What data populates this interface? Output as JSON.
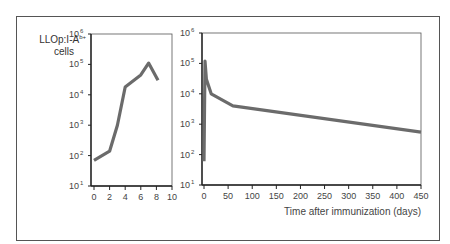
{
  "chart_data": [
    {
      "type": "line",
      "title": "",
      "ylabel": "LLOp:I-Ab+ cells",
      "ylabel_main": "LLOp:I-A",
      "ylabel_sup": "b+",
      "ylabel_line2": "cells",
      "xlabel": "",
      "yscale": "log",
      "ylim": [
        10,
        1000000
      ],
      "xlim": [
        0,
        10
      ],
      "x_ticks": [
        0,
        2,
        4,
        6,
        8,
        10
      ],
      "y_ticks": [
        "10^1",
        "10^2",
        "10^3",
        "10^4",
        "10^5",
        "10^6"
      ],
      "series": [
        {
          "name": "LLOp:I-Ab+ cells",
          "x": [
            0,
            2,
            3,
            4,
            6,
            7,
            8.2
          ],
          "values": [
            70,
            140,
            1000,
            18000,
            45000,
            110000,
            30000
          ]
        }
      ],
      "grid": false,
      "line_color": "#6b6b6b"
    },
    {
      "type": "line",
      "title": "",
      "ylabel": "",
      "xlabel": "Time after immunization (days)",
      "yscale": "log",
      "ylim": [
        10,
        1000000
      ],
      "xlim": [
        0,
        450
      ],
      "x_ticks": [
        0,
        50,
        100,
        150,
        200,
        250,
        300,
        350,
        400,
        450
      ],
      "y_ticks": [
        "10^1",
        "10^2",
        "10^3",
        "10^4",
        "10^5",
        "10^6"
      ],
      "series": [
        {
          "name": "LLOp:I-Ab+ cells",
          "x": [
            0,
            2,
            5,
            15,
            60,
            450
          ],
          "values": [
            60,
            120000,
            30000,
            10000,
            4000,
            550
          ]
        }
      ],
      "grid": false,
      "line_color": "#6b6b6b"
    }
  ]
}
